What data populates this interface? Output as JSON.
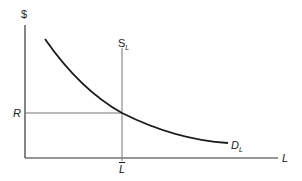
{
  "diagram": {
    "type": "labor-market-supply-demand",
    "y_axis_label": "$",
    "x_axis_label": "L",
    "supply": {
      "label": "S",
      "subscript": "L",
      "style": "vertical line"
    },
    "demand": {
      "label": "D",
      "subscript": "L",
      "style": "downward sloping convex curve"
    },
    "wage_level_label": "R",
    "quantity_label": "L",
    "quantity_label_overbar": true,
    "colors": {
      "curve": "#1a1a1a",
      "axis": "#333333",
      "guide": "#777777"
    }
  }
}
